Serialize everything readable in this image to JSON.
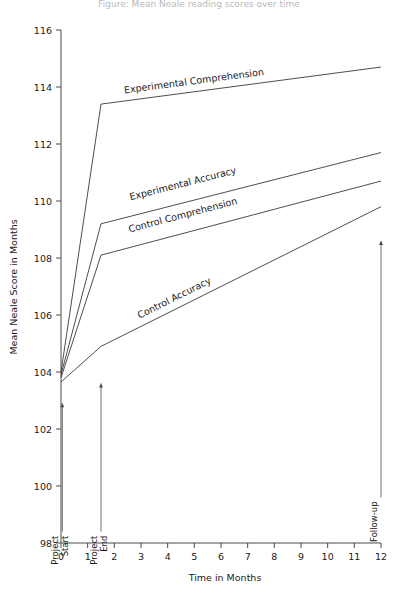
{
  "chart_data": {
    "type": "line",
    "title": "Figure: Mean Neale reading scores over time",
    "xlabel": "Time in Months",
    "ylabel": "Mean Neale Score in Months",
    "xlim": [
      0,
      12
    ],
    "ylim": [
      98,
      116
    ],
    "xticks": [
      "0",
      "1",
      "2",
      "3",
      "4",
      "5",
      "6",
      "7",
      "8",
      "9",
      "10",
      "11",
      "12"
    ],
    "yticks": [
      "98",
      "100",
      "102",
      "104",
      "106",
      "108",
      "110",
      "112",
      "114",
      "116"
    ],
    "grid": false,
    "legend_position": "inline-labels",
    "x": [
      0,
      1.5,
      12
    ],
    "series": [
      {
        "name": "Experimental Comprehension",
        "values": [
          104.0,
          113.4,
          114.7
        ],
        "label_x": 5.0,
        "label_y": 114.1
      },
      {
        "name": "Experimental Accuracy",
        "values": [
          103.9,
          109.2,
          111.7
        ],
        "label_x": 4.6,
        "label_y": 110.5
      },
      {
        "name": "Control Comprehension",
        "values": [
          103.8,
          108.1,
          110.7
        ],
        "label_x": 4.6,
        "label_y": 109.4
      },
      {
        "name": "Control Accuracy",
        "values": [
          103.65,
          104.9,
          109.8
        ],
        "label_x": 4.3,
        "label_y": 106.5
      }
    ],
    "annotations": [
      {
        "name": "Project Start",
        "x": 0.05,
        "y_from": 98.4,
        "y_to": 102.9
      },
      {
        "name": "Project End",
        "x": 1.5,
        "y_from": 98.4,
        "y_to": 103.6
      },
      {
        "name": "Follow-up",
        "x": 12.0,
        "y_from": 99.6,
        "y_to": 108.6
      }
    ]
  }
}
